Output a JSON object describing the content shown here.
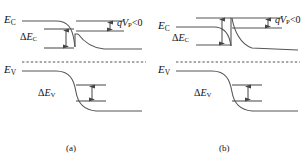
{
  "figure": {
    "type": "semiconductor-band-diagram",
    "panel_count": 2,
    "caption_a": "(a)",
    "caption_b": "(b)",
    "line_color": "#555555",
    "text_color": "#111111",
    "background": "#ffffff"
  },
  "symbols": {
    "Ec_base": "E",
    "Ec_sub": "C",
    "Ev_base": "E",
    "Ev_sub": "V",
    "delta": "Δ",
    "dEc_base": "E",
    "dEc_sub": "C",
    "dEv_base": "E",
    "dEv_sub": "V",
    "bias_q": "q",
    "bias_V": "V",
    "bias_sub": "P",
    "bias_rel": "<0"
  },
  "panel_a": {
    "name": "panel-a",
    "caption": "(a)",
    "labels": {
      "conduction_band": "E_C",
      "valence_band": "E_V",
      "conduction_offset": "ΔE_C",
      "valence_offset": "ΔE_V",
      "bias": "qV_P<0"
    },
    "features": {
      "conduction_band_shape": "flat-left-then-downward-step-with-notch",
      "valence_band_shape": "flat-left-then-downward-step",
      "dashed_reference_line": true,
      "offset_arrow_conduction": "double-headed-vertical",
      "offset_arrow_valence": "double-headed-vertical",
      "bias_arrow": "double-headed-vertical-small"
    }
  },
  "panel_b": {
    "name": "panel-b",
    "caption": "(b)",
    "labels": {
      "conduction_band": "E_C",
      "valence_band": "E_V",
      "conduction_offset": "ΔE_C",
      "valence_offset": "ΔE_V",
      "bias": "qV_P<0"
    },
    "features": {
      "conduction_band_shape": "flat-left-then-downward-curve-with-spike",
      "valence_band_shape": "flat-left-then-downward-step",
      "dashed_reference_line": true,
      "offset_arrow_conduction": "double-headed-vertical",
      "offset_arrow_valence": "double-headed-vertical",
      "bias_arrow": "double-headed-vertical-small"
    }
  }
}
